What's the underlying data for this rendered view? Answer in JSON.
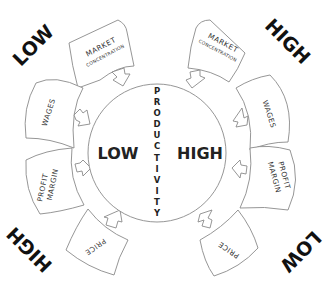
{
  "diagram": {
    "center_circle": {
      "axis_label": "PRODUCTIVITY",
      "left_label": "LOW",
      "right_label": "HIGH"
    },
    "corner_labels": {
      "top_left": "LOW",
      "top_right": "HIGH",
      "bottom_left": "HIGH",
      "bottom_right": "LOW"
    },
    "left_cards": [
      {
        "line1": "MARKET",
        "line2": "CONCENTRATION"
      },
      {
        "line1": "WAGES",
        "line2": ""
      },
      {
        "line1": "PROFIT",
        "line2": "MARGIN"
      },
      {
        "line1": "PRICE",
        "line2": ""
      }
    ],
    "right_cards": [
      {
        "line1": "MARKET",
        "line2": "CONCENTRATION"
      },
      {
        "line1": "WAGES",
        "line2": ""
      },
      {
        "line1": "PROFIT",
        "line2": "MARGIN"
      },
      {
        "line1": "PRICE",
        "line2": ""
      }
    ],
    "colors": {
      "line": "#8a8a8a",
      "text": "#1a1a1a",
      "background": "#ffffff"
    }
  }
}
